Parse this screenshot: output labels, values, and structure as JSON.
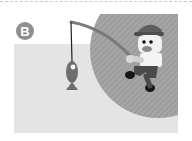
{
  "figure": {
    "badge_label": "B",
    "colors": {
      "background": "#ffffff",
      "panel": "#e4e4e4",
      "circle": "#9a9a9a",
      "badge": "#8e8e8e",
      "fish": "#6e6e6e",
      "line": "#222222"
    }
  }
}
